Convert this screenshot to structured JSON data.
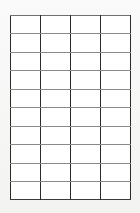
{
  "page": {
    "background_color": "#f7f7f7"
  },
  "table": {
    "name": "blank-grid-table",
    "column_count": 4,
    "row_count": 10,
    "cells_empty": true,
    "vertical_line_color": "#2b2b2b",
    "horizontal_line_color": "#8a8a8a",
    "cell_background_color": "#ffffff",
    "columns": [
      "",
      "",
      "",
      ""
    ],
    "rows": [
      [
        "",
        "",
        "",
        ""
      ],
      [
        "",
        "",
        "",
        ""
      ],
      [
        "",
        "",
        "",
        ""
      ],
      [
        "",
        "",
        "",
        ""
      ],
      [
        "",
        "",
        "",
        ""
      ],
      [
        "",
        "",
        "",
        ""
      ],
      [
        "",
        "",
        "",
        ""
      ],
      [
        "",
        "",
        "",
        ""
      ],
      [
        "",
        "",
        "",
        ""
      ],
      [
        "",
        "",
        "",
        ""
      ]
    ]
  }
}
